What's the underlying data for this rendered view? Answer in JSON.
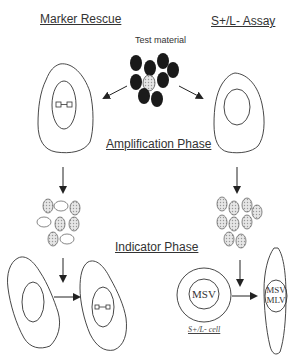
{
  "headings": {
    "left": "Marker Rescue",
    "right": "S+/L- Assay",
    "amplification": "Amplification Phase",
    "indicator": "Indicator Phase"
  },
  "test_material_label": "Test material",
  "cell_labels": {
    "s_l_cell": "S+/L- cell",
    "msv": "MSV",
    "msv_mlv_line1": "MSV",
    "msv_mlv_line2": "MLV"
  },
  "colors": {
    "outline": "#333333",
    "dark_particle": "#1a1a1a",
    "stippled_particle": "#cfcfcf"
  }
}
